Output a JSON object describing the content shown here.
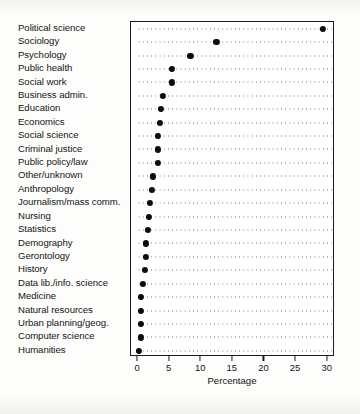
{
  "chart_data": {
    "type": "scatter",
    "title": "",
    "xlabel": "Percentage",
    "ylabel": "",
    "xlim": [
      0,
      31
    ],
    "xticks": [
      0,
      5,
      10,
      15,
      20,
      25,
      30
    ],
    "xticklabels": [
      "0",
      "5",
      "10",
      "15",
      "20",
      "25",
      "30"
    ],
    "grid": "horizontal-dotted",
    "legend": "none",
    "orientation": "horizontal-dotplot",
    "marker": "filled-circle",
    "marker_color": "#0c0c0c",
    "frame_color": "#1a1a1a",
    "categories": [
      "Political science",
      "Sociology",
      "Psychology",
      "Public health",
      "Social work",
      "Business admin.",
      "Education",
      "Economics",
      "Social science",
      "Criminal justice",
      "Public policy/law",
      "Other/unknown",
      "Anthropology",
      "Journalism/mass comm.",
      "Nursing",
      "Statistics",
      "Demography",
      "Gerontology",
      "History",
      "Data lib./info. science",
      "Medicine",
      "Natural resources",
      "Urban planning/geog.",
      "Computer science",
      "Humanities"
    ],
    "values": [
      29.2,
      12.4,
      8.3,
      5.4,
      5.4,
      4.0,
      3.6,
      3.5,
      3.2,
      3.2,
      3.1,
      2.3,
      2.2,
      1.9,
      1.7,
      1.6,
      1.3,
      1.2,
      1.1,
      0.8,
      0.5,
      0.5,
      0.4,
      0.4,
      0.2
    ]
  }
}
